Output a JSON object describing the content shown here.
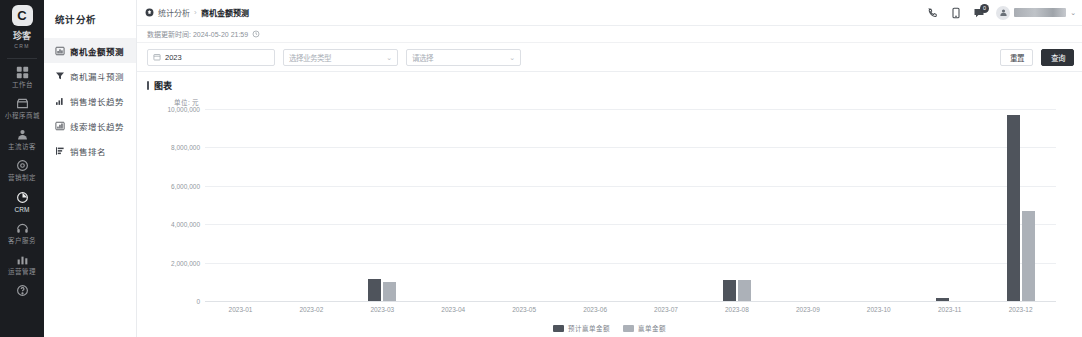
{
  "rail": {
    "logo": {
      "mark": "C",
      "name": "珍客",
      "sub": "CRM"
    },
    "items": [
      {
        "label": "工作台",
        "icon": "grid-icon"
      },
      {
        "label": "小程序商城",
        "icon": "shop-icon"
      },
      {
        "label": "主流访客",
        "icon": "visitor-icon"
      },
      {
        "label": "营销制定",
        "icon": "target-icon"
      },
      {
        "label": "CRM",
        "icon": "pie-icon"
      },
      {
        "label": "客户服务",
        "icon": "service-icon"
      },
      {
        "label": "运营管理",
        "icon": "stats-icon"
      },
      {
        "label": "",
        "icon": "help-icon"
      }
    ]
  },
  "subnav": {
    "title": "统计分析",
    "items": [
      {
        "label": "商机金额预测",
        "icon": "bar-chart-icon"
      },
      {
        "label": "商机漏斗预测",
        "icon": "funnel-icon"
      },
      {
        "label": "销售增长趋势",
        "icon": "trend-up-icon"
      },
      {
        "label": "线索增长趋势",
        "icon": "column-chart-icon"
      },
      {
        "label": "销售排名",
        "icon": "rank-icon"
      }
    ]
  },
  "topbar": {
    "breadcrumb": {
      "root": "统计分析",
      "separator": "›",
      "current": "商机金额预测"
    },
    "icons": [
      {
        "name": "phone-icon"
      },
      {
        "name": "tablet-icon"
      },
      {
        "name": "message-icon",
        "badge": "0"
      }
    ],
    "user": {
      "name": "",
      "caret": "⌄"
    }
  },
  "update": {
    "label": "数据更新时间: 2024-05-20 21:59"
  },
  "filters": {
    "year": {
      "value": "2023"
    },
    "business_type": {
      "placeholder": "选择业务类型"
    },
    "extra": {
      "placeholder": "请选择"
    },
    "reset_label": "重置",
    "query_label": "查询"
  },
  "chart_section": {
    "title": "图表",
    "unit": "单位: 元"
  },
  "chart_data": {
    "type": "bar",
    "title": "图表",
    "xlabel": "",
    "ylabel": "单位: 元",
    "ylim": [
      0,
      10000000
    ],
    "yticks": [
      "10,000,000",
      "8,000,000",
      "6,000,000",
      "4,000,000",
      "2,000,000",
      "0"
    ],
    "ytick_values": [
      10000000,
      8000000,
      6000000,
      4000000,
      2000000,
      0
    ],
    "grid": true,
    "legend_position": "bottom",
    "categories": [
      "2023-01",
      "2023-02",
      "2023-03",
      "2023-04",
      "2023-05",
      "2023-06",
      "2023-07",
      "2023-08",
      "2023-09",
      "2023-10",
      "2023-11",
      "2023-12"
    ],
    "series": [
      {
        "name": "预计赢单金额",
        "color": "#4f545c",
        "values": [
          0,
          0,
          1150000,
          0,
          0,
          0,
          0,
          1120000,
          0,
          0,
          180000,
          9700000
        ]
      },
      {
        "name": "赢单金额",
        "color": "#acb1b8",
        "values": [
          0,
          0,
          980000,
          0,
          0,
          0,
          0,
          1080000,
          0,
          0,
          0,
          4680000
        ]
      }
    ]
  }
}
